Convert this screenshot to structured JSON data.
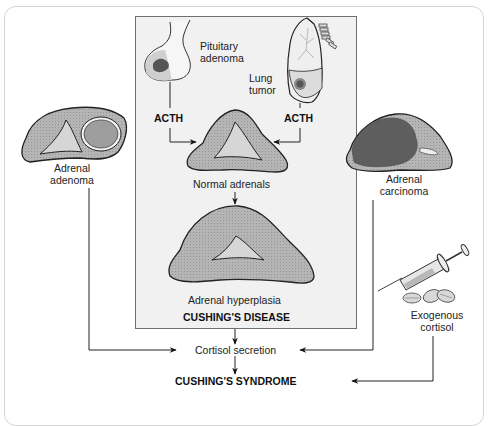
{
  "figure": {
    "colors": {
      "background": "#ffffff",
      "disease_box_fill": "#f1f1f1",
      "adrenal_cortex": "#b5b5b5",
      "adrenal_medulla": "#d6d6d6",
      "tumor_dark": "#6a6a6a",
      "outline": "#222222",
      "frame": "#d4d4d4"
    }
  },
  "central_box": {
    "pituitary_label_line1": "Pituitary",
    "pituitary_label_line2": "adenoma",
    "lung_label_line1": "Lung",
    "lung_label_line2": "tumor",
    "acth_left": "ACTH",
    "acth_right": "ACTH",
    "normal_adrenals": "Normal adrenals",
    "adrenal_hyperplasia": "Adrenal hyperplasia",
    "heading": "CUSHING'S DISEASE"
  },
  "left_cause": {
    "label_line1": "Adrenal",
    "label_line2": "adenoma"
  },
  "right_cause": {
    "label_line1": "Adrenal",
    "label_line2": "carcinoma"
  },
  "exogenous": {
    "label_line1": "Exogenous",
    "label_line2": "cortisol"
  },
  "outcomes": {
    "cortisol_secretion": "Cortisol secretion",
    "syndrome": "CUSHING'S SYNDROME"
  },
  "icons": [
    "pituitary-gland-icon",
    "lung-icon",
    "adrenal-gland-icon",
    "syringe-icon",
    "pill-icon"
  ]
}
